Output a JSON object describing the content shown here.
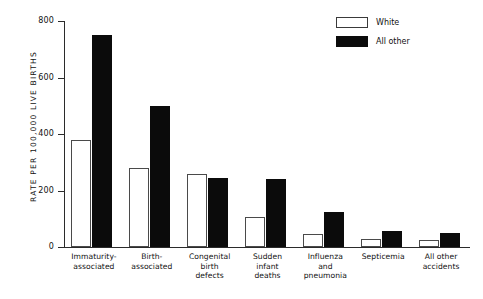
{
  "chart_data": {
    "type": "bar",
    "title": "",
    "xlabel": "",
    "ylabel": "RATE PER 100,000 LIVE BIRTHS",
    "ylim": [
      0,
      800
    ],
    "yticks": [
      0,
      200,
      400,
      600,
      800
    ],
    "ytick_labels": [
      "0",
      "200",
      "400",
      "600",
      "800"
    ],
    "grid": false,
    "legend_position": "top-right",
    "categories": [
      "Immaturity-\nassociated",
      "Birth-\nassociated",
      "Congenital\nbirth\ndefects",
      "Sudden\ninfant\ndeaths",
      "Influenza\nand\npneumonia",
      "Septicemia",
      "All other\naccidents"
    ],
    "category_lines": [
      [
        "Immaturity-",
        "associated"
      ],
      [
        "Birth-",
        "associated"
      ],
      [
        "Congenital",
        "birth",
        "defects"
      ],
      [
        "Sudden",
        "infant",
        "deaths"
      ],
      [
        "Influenza",
        "and",
        "pneumonia"
      ],
      [
        "Septicemia"
      ],
      [
        "All other",
        "accidents"
      ]
    ],
    "series": [
      {
        "name": "White",
        "color": "#ffffff",
        "edge_color": "#4a4a4a",
        "values": [
          380,
          280,
          260,
          105,
          45,
          30,
          25
        ]
      },
      {
        "name": "All other",
        "color": "#0b0b0b",
        "edge_color": "#0b0b0b",
        "values": [
          750,
          500,
          245,
          240,
          125,
          55,
          50
        ]
      }
    ]
  },
  "legend": {
    "items": [
      {
        "label": "White",
        "swatch": "white"
      },
      {
        "label": "All other",
        "swatch": "black"
      }
    ]
  },
  "axis": {
    "y_title": "RATE PER 100,000 LIVE BIRTHS"
  }
}
